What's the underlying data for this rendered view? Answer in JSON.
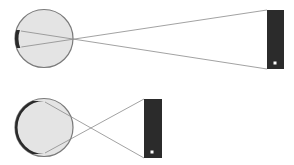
{
  "diagram": {
    "type": "visual-angle-retinal-image",
    "colors": {
      "background": "#ffffff",
      "eye_fill": "#e4e4e4",
      "eye_stroke": "#7a7a7a",
      "retina_image": "#2a2a2a",
      "object_fill": "#2b2b2b",
      "object_dot": "#ffffff",
      "ray": "#8a8a8a"
    },
    "panels": [
      {
        "id": "far-object",
        "eye": {
          "cx": 44,
          "cy": 38.5,
          "r": 29
        },
        "focal_point": {
          "x": 72,
          "y": 39
        },
        "retina_image": {
          "top_y": 30,
          "bottom_y": 48
        },
        "object": {
          "x": 267,
          "y": 10,
          "width": 17,
          "height": 59,
          "dot": {
            "x": 275,
            "y": 63
          }
        }
      },
      {
        "id": "near-object",
        "eye": {
          "cx": 44,
          "cy": 127.5,
          "r": 29
        },
        "focal_point": {
          "x": 72,
          "y": 128
        },
        "retina_image": {
          "top_y": 101,
          "bottom_y": 154
        },
        "object": {
          "x": 144,
          "y": 99,
          "width": 18,
          "height": 59,
          "dot": {
            "x": 152,
            "y": 152
          }
        }
      }
    ]
  }
}
